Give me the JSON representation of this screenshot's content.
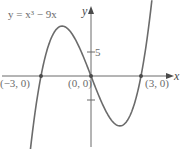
{
  "chart_data": {
    "type": "line",
    "title": "",
    "equation_label": "y = x³ − 9x",
    "xlabel": "x",
    "ylabel": "y",
    "xlim": [
      -5.46,
      5.52
    ],
    "ylim": [
      -15.8,
      15.8
    ],
    "grid": false,
    "y_ticks": [
      {
        "value": 5,
        "label": "5"
      },
      {
        "value": -5,
        "label": ""
      }
    ],
    "series": [
      {
        "name": "y = x^3 - 9x",
        "function": "x^3 - 9x",
        "x_range": [
          -3.65,
          3.65
        ],
        "color": "#6b6b6b"
      }
    ],
    "points": [
      {
        "x": -3,
        "y": 0,
        "label": "(−3, 0)"
      },
      {
        "x": 0,
        "y": 0,
        "label": "(0, 0)"
      },
      {
        "x": 3,
        "y": 0,
        "label": "(3, 0)"
      }
    ]
  }
}
